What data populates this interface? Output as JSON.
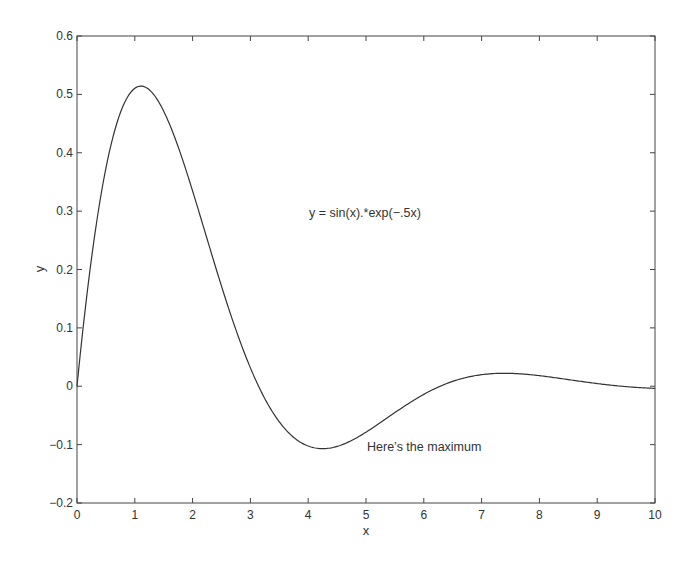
{
  "chart_data": {
    "type": "line",
    "title": "",
    "xlabel": "x",
    "ylabel": "y",
    "xlim": [
      0,
      10
    ],
    "ylim": [
      -0.2,
      0.6
    ],
    "xticks": [
      0,
      1,
      2,
      3,
      4,
      5,
      6,
      7,
      8,
      9,
      10
    ],
    "xtick_labels": [
      "0",
      "1",
      "2",
      "3",
      "4",
      "5",
      "6",
      "7",
      "8",
      "9",
      "10"
    ],
    "yticks": [
      -0.2,
      -0.1,
      0,
      0.1,
      0.2,
      0.3,
      0.4,
      0.5,
      0.6
    ],
    "ytick_labels": [
      "−0.2",
      "−0.1",
      "0",
      "0.1",
      "0.2",
      "0.3",
      "0.4",
      "0.5",
      "0.6"
    ],
    "grid": false,
    "legend": null,
    "series": [
      {
        "name": "y = sin(x).*exp(-.5x)",
        "function": "sin(x)*exp(-0.5*x)",
        "x": [
          0,
          0.5,
          1,
          1.107,
          1.5,
          2,
          2.5,
          3,
          3.5,
          4,
          4.249,
          4.5,
          5,
          5.5,
          6,
          6.5,
          7,
          7.39,
          7.5,
          8,
          8.5,
          9,
          9.5,
          10
        ],
        "values": [
          0,
          0.373,
          0.51,
          0.514,
          0.471,
          0.335,
          0.171,
          0.031,
          -0.061,
          -0.102,
          -0.105,
          -0.103,
          -0.079,
          -0.045,
          -0.014,
          0.008,
          0.02,
          0.023,
          0.022,
          0.018,
          0.011,
          0.005,
          -0.0,
          -0.004
        ]
      }
    ],
    "annotations": [
      {
        "text": "y = sin(x).*exp(−.5x)",
        "x": 4.1,
        "y": 0.32
      },
      {
        "text": "Here’s the maximum",
        "x": 5.0,
        "y": -0.1
      }
    ]
  },
  "labels": {
    "xlabel": "x",
    "ylabel": "y",
    "formula": "y = sin(x).*exp(−.5x)",
    "note": "Here’s the maximum"
  }
}
